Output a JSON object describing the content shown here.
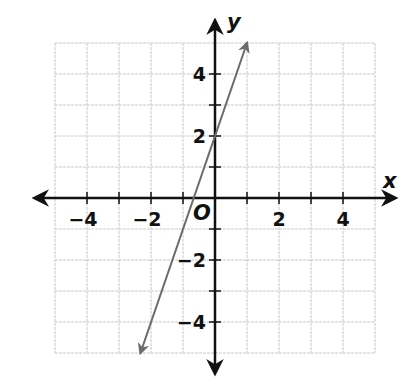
{
  "chart_data": {
    "type": "line",
    "title": "",
    "xlabel": "x",
    "ylabel": "y",
    "origin_label": "O",
    "xlim": [
      -5,
      5
    ],
    "ylim": [
      -5,
      5
    ],
    "grid": true,
    "x_tick_labels": [
      "−4",
      "−2",
      "2",
      "4"
    ],
    "x_tick_values": [
      -4,
      -2,
      2,
      4
    ],
    "y_tick_labels": [
      "4",
      "2",
      "−2",
      "−4"
    ],
    "y_tick_values": [
      4,
      2,
      -2,
      -4
    ],
    "series": [
      {
        "name": "line",
        "equation": "y = 3x + 2",
        "slope": 3,
        "y_intercept": 2,
        "x": [
          -2.33,
          1
        ],
        "y": [
          -5,
          5
        ],
        "arrows_both_ends": true,
        "color": "#6b6b6b"
      }
    ]
  },
  "colors": {
    "grid": "#c8c8c8",
    "axes": "#111111",
    "line": "#6b6b6b"
  }
}
